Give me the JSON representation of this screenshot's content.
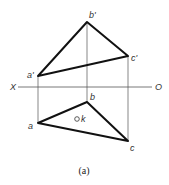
{
  "diagram": {
    "caption": "(a)",
    "axis": {
      "left_label": "X",
      "right_label": "O"
    },
    "front_view": {
      "points": [
        {
          "name": "a'",
          "x": 38,
          "y": 76
        },
        {
          "name": "b'",
          "x": 87,
          "y": 22
        },
        {
          "name": "c'",
          "x": 128,
          "y": 56
        }
      ]
    },
    "top_view": {
      "points": [
        {
          "name": "a",
          "x": 38,
          "y": 123
        },
        {
          "name": "b",
          "x": 87,
          "y": 102
        },
        {
          "name": "c",
          "x": 128,
          "y": 141
        }
      ],
      "marker": {
        "name": "k",
        "x": 77,
        "y": 119
      }
    },
    "colors": {
      "edges": "#111111",
      "projectors": "#555555",
      "labels": "#333333"
    }
  }
}
